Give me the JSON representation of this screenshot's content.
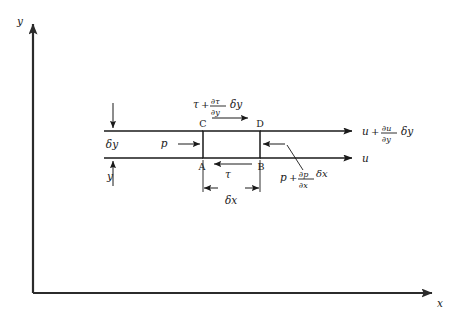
{
  "figure": {
    "kind": "fluid-element-stress-diagram",
    "background_color": "#ffffff",
    "ink_color": "#1a1a1a",
    "axes": {
      "y_label": "y",
      "x_label": "x",
      "origin_px": [
        33,
        293
      ],
      "y_top_px": 16,
      "x_right_px": 443
    },
    "element": {
      "corner_labels": {
        "top_left": "C",
        "top_right": "D",
        "bottom_left": "A",
        "bottom_right": "B"
      },
      "rect_px": {
        "x": 203,
        "y": 131,
        "width": 57,
        "height": 27
      }
    },
    "labels": {
      "top_shear": {
        "base": "τ",
        "plus": "+",
        "numerator": "∂τ",
        "denominator": "∂y",
        "multiplier": "δy",
        "full_text": "τ + ∂τ/∂y δy"
      },
      "bottom_shear": {
        "base": "τ",
        "full_text": "τ"
      },
      "left_pressure": {
        "base": "p",
        "full_text": "p"
      },
      "right_pressure": {
        "base": "p",
        "plus": "+",
        "numerator": "∂p",
        "denominator": "∂x",
        "multiplier": "δx",
        "full_text": "p + ∂p/∂x δx"
      },
      "top_velocity": {
        "base": "u",
        "plus": "+",
        "numerator": "∂u",
        "denominator": "∂y",
        "multiplier": "δy",
        "full_text": "u + ∂u/∂y δy"
      },
      "bottom_velocity": {
        "base": "u",
        "full_text": "u"
      },
      "height_dimension": {
        "text": "δy"
      },
      "width_dimension": {
        "text": "δx"
      },
      "wall_distance": {
        "text": "y"
      }
    }
  }
}
